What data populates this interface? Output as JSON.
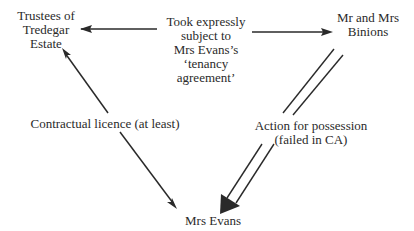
{
  "diagram": {
    "type": "relationship-triangle",
    "colors": {
      "background": "#ffffff",
      "ink": "#2a2a2a"
    },
    "nodes": {
      "trustees": {
        "lines": [
          "Trustees of",
          "Tredegar",
          "Estate"
        ]
      },
      "binions": {
        "lines": [
          "Mr and Mrs",
          "Binions"
        ]
      },
      "evans": {
        "lines": [
          "Mrs Evans"
        ]
      }
    },
    "edges": {
      "took": {
        "from": "binions",
        "to": "trustees",
        "style": "single-line, double-headed",
        "label_lines": [
          "Took expressly",
          "subject to",
          "Mrs Evans’s",
          "‘tenancy",
          "agreement’"
        ]
      },
      "licence": {
        "from": "trustees",
        "to": "evans",
        "style": "single-line, double-headed",
        "label_lines": [
          "Contractual licence (at least)"
        ]
      },
      "action": {
        "from": "binions",
        "to": "evans",
        "style": "double-line, single large arrowhead",
        "label_lines": [
          "Action for possession",
          "(failed in CA)"
        ]
      }
    }
  }
}
